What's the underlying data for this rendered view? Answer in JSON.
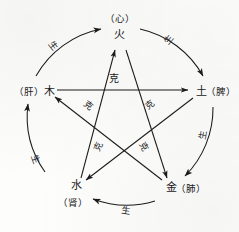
{
  "diagram": {
    "type": "five-elements-cycle",
    "stroke_color": "#1b1b1b",
    "background_color": "#fdfdfc",
    "nodes": [
      {
        "id": "fire",
        "element": "火",
        "organ": "（心）",
        "organ_position": "above",
        "x": 119.5,
        "y": 38
      },
      {
        "id": "earth",
        "element": "土",
        "organ": "（脾）",
        "organ_position": "right",
        "x": 200,
        "y": 92
      },
      {
        "id": "metal",
        "element": "金",
        "organ": "（肺）",
        "organ_position": "right",
        "x": 170,
        "y": 188
      },
      {
        "id": "water",
        "element": "水",
        "organ": "（肾）",
        "organ_position": "below",
        "x": 76,
        "y": 188
      },
      {
        "id": "wood",
        "element": "木",
        "organ": "（肝）",
        "organ_position": "left",
        "x": 44,
        "y": 92
      }
    ],
    "generating_cycle": {
      "name": "生",
      "label": "生",
      "description": "outer-arcs",
      "edges": [
        {
          "from": "wood",
          "to": "fire",
          "label": "生",
          "label_x": 51,
          "label_y": 48,
          "label_rotate": 52
        },
        {
          "from": "fire",
          "to": "earth",
          "label": "生",
          "label_x": 171,
          "label_y": 42,
          "label_rotate": -50
        },
        {
          "from": "earth",
          "to": "metal",
          "label": "生",
          "label_x": 206,
          "label_y": 136,
          "label_rotate": -80
        },
        {
          "from": "metal",
          "to": "water",
          "label": "生",
          "label_x": 125,
          "label_y": 214,
          "label_rotate": 8
        },
        {
          "from": "water",
          "to": "wood",
          "label": "生",
          "label_x": 33,
          "label_y": 160,
          "label_rotate": 70
        }
      ]
    },
    "overcoming_cycle": {
      "name": "克",
      "label": "克",
      "description": "inner-pentagram",
      "edges": [
        {
          "from": "wood",
          "to": "earth",
          "label": "克",
          "label_x": 114,
          "label_y": 82,
          "label_rotate": 0
        },
        {
          "from": "earth",
          "to": "water",
          "label": "克",
          "label_x": 152,
          "label_y": 107,
          "label_rotate": -38
        },
        {
          "from": "water",
          "to": "fire",
          "label": "克",
          "label_x": 141,
          "label_y": 148,
          "label_rotate": 62
        },
        {
          "from": "fire",
          "to": "metal",
          "label": "克",
          "label_x": 101,
          "label_y": 148,
          "label_rotate": -64
        },
        {
          "from": "metal",
          "to": "wood",
          "label": "克",
          "label_x": 87,
          "label_y": 108,
          "label_rotate": 38
        }
      ]
    }
  }
}
